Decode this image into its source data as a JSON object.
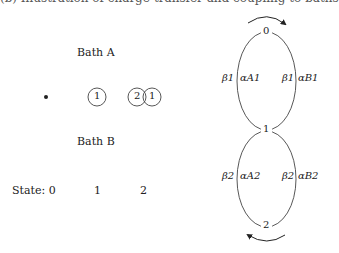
{
  "caption_cropped": "(b) Illustration of charge-transfer and coupling to baths",
  "left_panel": {
    "bath_a_label": "Bath A",
    "bath_b_label": "Bath B",
    "states_label": "State: 0",
    "state_1": "1",
    "state_2": "2",
    "sites": [
      {
        "state": 0,
        "glyphs": []
      },
      {
        "state": 1,
        "glyphs": [
          "1"
        ]
      },
      {
        "state": 2,
        "glyphs": [
          "2",
          "1"
        ]
      }
    ]
  },
  "right_panel": {
    "nodes": [
      "0",
      "1",
      "2"
    ],
    "upper_loop": {
      "left_outer": "β1",
      "left_inner": "αA1",
      "right_outer": "β1",
      "right_inner": "αB1",
      "arrow": "clockwise"
    },
    "lower_loop": {
      "left_outer": "β2",
      "left_inner": "αA2",
      "right_outer": "β2",
      "right_inner": "αB2",
      "arrow": "clockwise"
    }
  }
}
